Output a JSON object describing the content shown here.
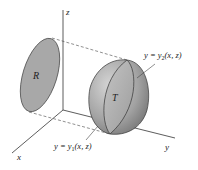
{
  "diagram": {
    "type": "3d-region-projection",
    "axes": {
      "x": "x",
      "y": "y",
      "z": "z"
    },
    "region_label": "R",
    "solid_label": "T",
    "upper_surface": {
      "prefix": "y = y",
      "sub": "2",
      "suffix": "(x, z)"
    },
    "lower_surface": {
      "prefix": "y = y",
      "sub": "1",
      "suffix": "(x, z)"
    },
    "colors": {
      "region_fill": "#a8a8a8",
      "solid_fill": "#9a9a9a",
      "axis": "#333333"
    }
  }
}
